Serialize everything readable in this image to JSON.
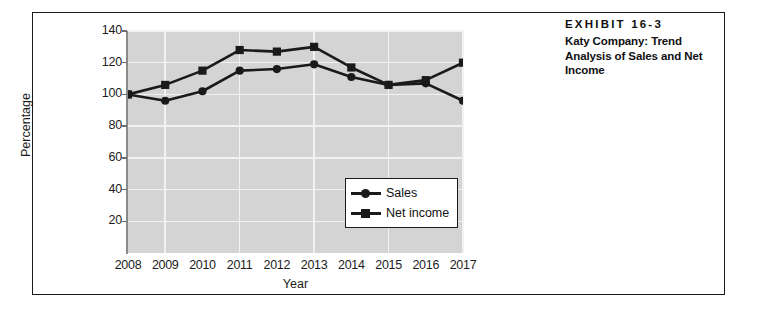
{
  "caption": {
    "exhibit_label": "EXHIBIT 16-3",
    "title": "Katy Company: Trend Analysis of Sales and Net Income"
  },
  "colors": {
    "plot_background": "#d4d4d4",
    "gridline": "#f2f2f2",
    "series_line": "#1a1a1a",
    "frame_border": "#1a1a1a",
    "text": "#1c1c1c"
  },
  "chart_data": {
    "type": "line",
    "title": "Katy Company: Trend Analysis of Sales and Net Income",
    "xlabel": "Year",
    "ylabel": "Percentage",
    "categories": [
      "2008",
      "2009",
      "2010",
      "2011",
      "2012",
      "2013",
      "2014",
      "2015",
      "2016",
      "2017"
    ],
    "x": [
      2008,
      2009,
      2010,
      2011,
      2012,
      2013,
      2014,
      2015,
      2016,
      2017
    ],
    "ylim": [
      0,
      140
    ],
    "xlim": [
      2008,
      2017
    ],
    "yticks": [
      20,
      40,
      60,
      80,
      100,
      120,
      140
    ],
    "ytick_labels": [
      "20",
      "40",
      "60",
      "80",
      "100",
      "120",
      "140"
    ],
    "grid": true,
    "grid_axis": "both",
    "legend_position": "lower right inside plot",
    "series": [
      {
        "name": "Sales",
        "marker": "circle",
        "values": [
          100,
          96,
          102,
          115,
          116,
          119,
          111,
          106,
          107,
          96
        ]
      },
      {
        "name": "Net income",
        "marker": "square",
        "values": [
          100,
          106,
          115,
          128,
          127,
          130,
          117,
          106,
          109,
          120
        ]
      }
    ]
  }
}
